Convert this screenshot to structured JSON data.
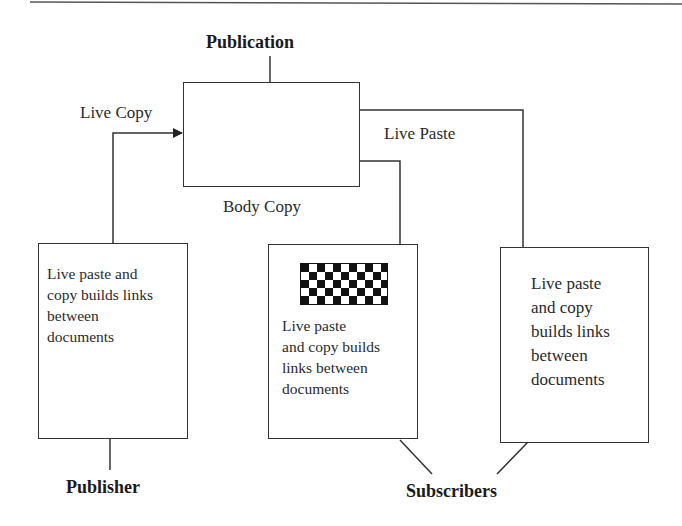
{
  "diagram": {
    "title": "Publication",
    "edges": {
      "live_copy": "Live Copy",
      "live_paste": "Live Paste",
      "body_copy": "Body Copy"
    },
    "publisher": {
      "label": "Publisher",
      "text": "Live paste and copy builds links between documents",
      "lines": [
        "Live paste and",
        "copy builds links",
        "between",
        "documents"
      ]
    },
    "subscribers": {
      "label": "Subscribers",
      "items": [
        {
          "has_graphic": true,
          "graphic": "checkerboard-pattern",
          "lines": [
            "Live paste",
            "and copy builds",
            "links between",
            "documents"
          ]
        },
        {
          "has_graphic": false,
          "lines": [
            "Live paste",
            "and copy",
            "builds links",
            "between",
            "documents"
          ]
        }
      ]
    },
    "colors": {
      "line": "#333333",
      "text": "#2a2a2a",
      "background": "#ffffff"
    }
  }
}
